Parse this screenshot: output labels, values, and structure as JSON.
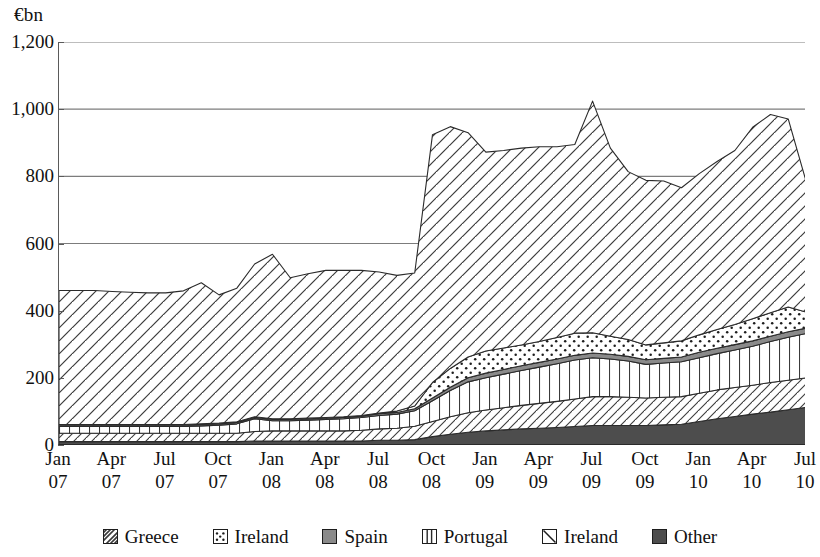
{
  "axis": {
    "unit_label": "€bn",
    "y_ticks": [
      "1,200",
      "1,000",
      "800",
      "600",
      "400",
      "200",
      "0"
    ],
    "y_values": [
      1200,
      1000,
      800,
      600,
      400,
      200,
      0
    ],
    "x_ticks": [
      {
        "month": "Jan",
        "year": "07"
      },
      {
        "month": "Apr",
        "year": "07"
      },
      {
        "month": "Jul",
        "year": "07"
      },
      {
        "month": "Oct",
        "year": "07"
      },
      {
        "month": "Jan",
        "year": "08"
      },
      {
        "month": "Apr",
        "year": "08"
      },
      {
        "month": "Jul",
        "year": "08"
      },
      {
        "month": "Oct",
        "year": "08"
      },
      {
        "month": "Jan",
        "year": "09"
      },
      {
        "month": "Apr",
        "year": "09"
      },
      {
        "month": "Jul",
        "year": "09"
      },
      {
        "month": "Oct",
        "year": "09"
      },
      {
        "month": "Jan",
        "year": "10"
      },
      {
        "month": "Apr",
        "year": "10"
      },
      {
        "month": "Jul",
        "year": "10"
      }
    ]
  },
  "legend": {
    "items": [
      {
        "label": "Greece",
        "pattern": "dense-diagonal",
        "color": "#7d7d7d"
      },
      {
        "label": "Ireland",
        "pattern": "dotted",
        "color": "#ffffff"
      },
      {
        "label": "Spain",
        "pattern": "solid-gray",
        "color": "#8a8a8a"
      },
      {
        "label": "Portugal",
        "pattern": "vertical-lines",
        "color": "#ffffff"
      },
      {
        "label": "Ireland",
        "pattern": "backslash",
        "color": "#ffffff"
      },
      {
        "label": "Other",
        "pattern": "solid-dark",
        "color": "#4d4d4d"
      }
    ]
  },
  "chart_data": {
    "type": "area",
    "title": "",
    "xlabel": "",
    "ylabel": "€bn",
    "ylim": [
      0,
      1200
    ],
    "grid": true,
    "legend_position": "bottom",
    "stacked": true,
    "stack_order_bottom_to_top": [
      "Other",
      "Greece",
      "Portugal",
      "Spain",
      "Ireland (dotted)",
      "Ireland (hatched)"
    ],
    "x": [
      "Jan 07",
      "Feb 07",
      "Mar 07",
      "Apr 07",
      "May 07",
      "Jun 07",
      "Jul 07",
      "Aug 07",
      "Sep 07",
      "Oct 07",
      "Nov 07",
      "Dec 07",
      "Jan 08",
      "Feb 08",
      "Mar 08",
      "Apr 08",
      "May 08",
      "Jun 08",
      "Jul 08",
      "Aug 08",
      "Sep 08",
      "Oct 08",
      "Nov 08",
      "Dec 08",
      "Jan 09",
      "Feb 09",
      "Mar 09",
      "Apr 09",
      "May 09",
      "Jun 09",
      "Jul 09",
      "Aug 09",
      "Sep 09",
      "Oct 09",
      "Nov 09",
      "Dec 09",
      "Jan 10",
      "Feb 10",
      "Mar 10",
      "Apr 10",
      "May 10",
      "Jun 10",
      "Jul 10"
    ],
    "series": [
      {
        "name": "Other",
        "pattern": "solid-dark",
        "color": "#4d4d4d",
        "values": [
          10,
          10,
          10,
          10,
          10,
          10,
          10,
          10,
          10,
          10,
          10,
          12,
          12,
          12,
          12,
          12,
          12,
          12,
          14,
          14,
          16,
          25,
          32,
          38,
          42,
          45,
          48,
          50,
          52,
          55,
          58,
          58,
          58,
          58,
          60,
          62,
          70,
          78,
          85,
          92,
          98,
          105,
          112
        ]
      },
      {
        "name": "Greece",
        "pattern": "dense-diagonal",
        "color": "#7d7d7d",
        "values": [
          25,
          25,
          25,
          25,
          25,
          25,
          25,
          25,
          25,
          25,
          25,
          28,
          30,
          30,
          30,
          30,
          30,
          32,
          34,
          36,
          40,
          45,
          52,
          58,
          62,
          66,
          70,
          74,
          78,
          82,
          86,
          86,
          84,
          82,
          82,
          82,
          84,
          86,
          86,
          86,
          88,
          88,
          88
        ]
      },
      {
        "name": "Portugal",
        "pattern": "vertical-lines",
        "color": "#ffffff",
        "values": [
          20,
          20,
          20,
          20,
          20,
          20,
          20,
          20,
          22,
          24,
          28,
          38,
          30,
          30,
          32,
          34,
          36,
          38,
          40,
          42,
          46,
          62,
          78,
          92,
          96,
          100,
          104,
          108,
          112,
          116,
          116,
          112,
          108,
          100,
          102,
          104,
          106,
          108,
          112,
          116,
          122,
          128,
          132
        ]
      },
      {
        "name": "Spain",
        "pattern": "solid-gray",
        "color": "#8a8a8a",
        "values": [
          4,
          4,
          4,
          4,
          4,
          4,
          4,
          4,
          4,
          4,
          4,
          4,
          4,
          4,
          4,
          4,
          4,
          4,
          5,
          5,
          6,
          8,
          10,
          12,
          14,
          14,
          14,
          14,
          14,
          14,
          14,
          14,
          14,
          14,
          14,
          14,
          16,
          16,
          16,
          16,
          16,
          16,
          16
        ]
      },
      {
        "name": "Ireland (dotted)",
        "pattern": "dotted",
        "color": "#ffffff",
        "values": [
          2,
          2,
          2,
          2,
          2,
          2,
          2,
          2,
          2,
          2,
          2,
          2,
          2,
          2,
          2,
          2,
          2,
          2,
          2,
          4,
          8,
          46,
          56,
          62,
          66,
          64,
          62,
          62,
          64,
          66,
          60,
          54,
          50,
          44,
          46,
          48,
          52,
          56,
          60,
          66,
          70,
          74,
          48
        ]
      },
      {
        "name": "Ireland (hatched)",
        "pattern": "forward-hatch",
        "color": "#ffffff",
        "values": [
          399,
          399,
          399,
          396,
          394,
          392,
          392,
          398,
          420,
          382,
          398,
          455,
          490,
          420,
          430,
          438,
          436,
          432,
          420,
          404,
          396,
          738,
          720,
          668,
          592,
          588,
          586,
          580,
          568,
          562,
          690,
          560,
          500,
          490,
          482,
          456,
          480,
          500,
          518,
          570,
          590,
          560,
          390
        ]
      }
    ],
    "totals": [
      460,
      460,
      460,
      457,
      455,
      453,
      453,
      459,
      483,
      447,
      467,
      539,
      668,
      498,
      510,
      518,
      520,
      520,
      515,
      505,
      512,
      924,
      908,
      930,
      872,
      877,
      884,
      888,
      888,
      895,
      1024,
      884,
      814,
      788,
      786,
      766,
      808,
      844,
      877,
      946,
      984,
      971,
      786
    ]
  }
}
